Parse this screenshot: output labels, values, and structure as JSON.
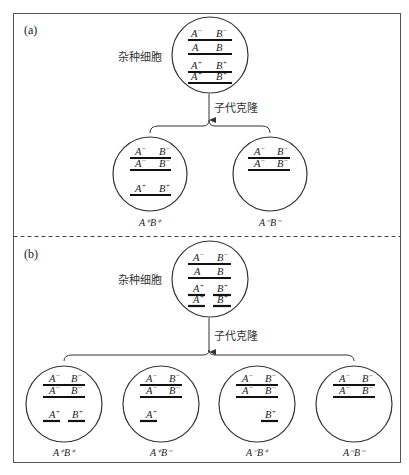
{
  "panels": {
    "a": {
      "label": "(a)",
      "hybrid_label": "杂种细胞",
      "arrow_label": "子代克隆",
      "hybrid_cell": {
        "chromosomes": [
          {
            "a": "A",
            "a_sup": "−",
            "b": "B",
            "b_sup": "−"
          },
          {
            "a": "A",
            "a_sup": "",
            "b": "B",
            "b_sup": ""
          },
          {
            "a": "A",
            "a_sup": "+",
            "b": "B",
            "b_sup": "+"
          },
          {
            "a": "A",
            "a_sup": "+",
            "b": "B",
            "b_sup": "+"
          }
        ]
      },
      "clones": [
        {
          "genotype": "A⁺B⁺",
          "chromosomes": [
            {
              "a": "A",
              "a_sup": "−",
              "b": "B",
              "b_sup": "−"
            },
            {
              "a": "A",
              "a_sup": "−",
              "b": "B",
              "b_sup": "−"
            },
            {
              "a": "A",
              "a_sup": "+",
              "b": "B",
              "b_sup": "+"
            }
          ]
        },
        {
          "genotype": "A⁻B⁻",
          "chromosomes": [
            {
              "a": "A",
              "a_sup": "−",
              "b": "B",
              "b_sup": "−"
            },
            {
              "a": "A",
              "a_sup": "−",
              "b": "B",
              "b_sup": "−"
            }
          ]
        }
      ]
    },
    "b": {
      "label": "(b)",
      "hybrid_label": "杂种细胞",
      "arrow_label": "子代克隆",
      "hybrid_cell": {
        "chromosomes": [
          {
            "a": "A",
            "a_sup": "−",
            "b": "B",
            "b_sup": "−",
            "split": false
          },
          {
            "a": "A",
            "a_sup": "",
            "b": "B",
            "b_sup": "",
            "split": false
          },
          {
            "a": "A",
            "a_sup": "+",
            "b": "B",
            "b_sup": "+",
            "split": true
          },
          {
            "a": "A",
            "a_sup": "+",
            "b": "B",
            "b_sup": "+",
            "split": true
          }
        ]
      },
      "clones": [
        {
          "genotype": "A⁺B⁺",
          "fragments": "A⁺, B⁺"
        },
        {
          "genotype": "A⁺B⁻",
          "fragments": "A⁺"
        },
        {
          "genotype": "A⁻B⁺",
          "fragments": "B⁺"
        },
        {
          "genotype": "A⁻B⁻",
          "fragments": ""
        }
      ]
    }
  },
  "text": {
    "a_sup_minus": "−",
    "plus": "+"
  }
}
